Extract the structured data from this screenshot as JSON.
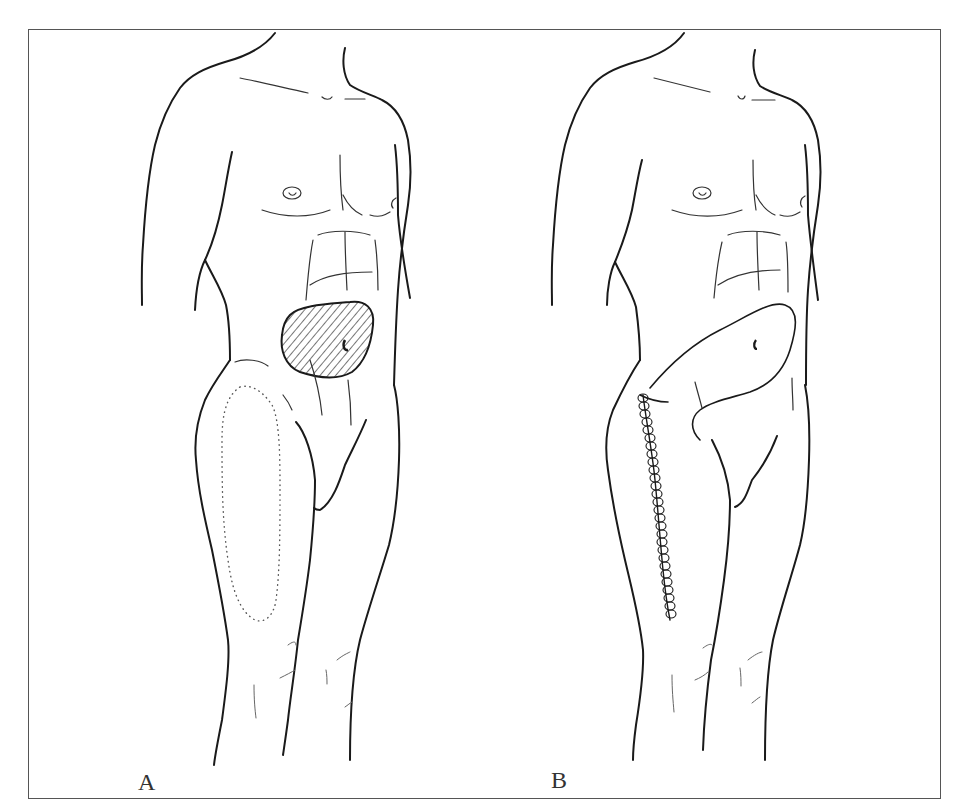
{
  "figure": {
    "panels": [
      {
        "label": "A",
        "description": "Male torso and thigh, front view; hatched lower abdominal defect with umbilicus; dotted outline of donor flap on anterolateral thigh"
      },
      {
        "label": "B",
        "description": "Flap transposed to cover lower abdominal defect; sutured donor site along lateral thigh"
      }
    ],
    "colors": {
      "line": "#1a1a1a",
      "frame": "#555555",
      "background": "#ffffff"
    }
  }
}
